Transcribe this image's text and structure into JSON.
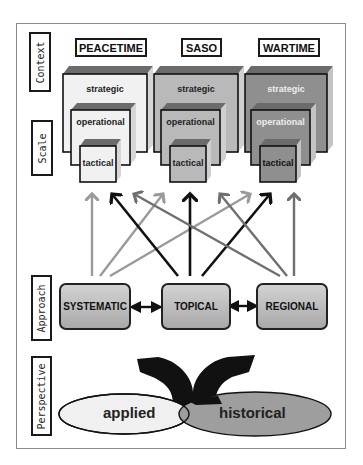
{
  "side_labels": {
    "context": "Context",
    "scale": "Scale",
    "approach": "Approach",
    "perspective": "Perspective"
  },
  "contexts": [
    {
      "label": "PEACETIME",
      "fill": "#f1f1f1"
    },
    {
      "label": "SASO",
      "fill": "#b9b9b9"
    },
    {
      "label": "WARTIME",
      "fill": "#8f8f8f"
    }
  ],
  "scale_levels": [
    "strategic",
    "operational",
    "tactical"
  ],
  "approaches": [
    {
      "label": "SYSTEMATIC",
      "arrow_color": "#9a9a9a"
    },
    {
      "label": "TOPICAL",
      "arrow_color": "#111111"
    },
    {
      "label": "REGIONAL",
      "arrow_color": "#6f6f6f"
    }
  ],
  "perspectives": [
    {
      "label": "applied",
      "fill": "#f0f0f0"
    },
    {
      "label": "historical",
      "fill": "#9e9e9e"
    }
  ]
}
